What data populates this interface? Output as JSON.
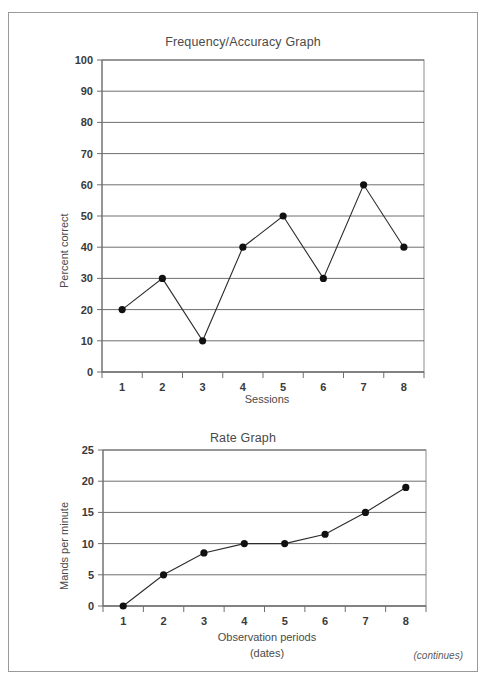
{
  "page": {
    "note": "(continues)"
  },
  "chart_data": [
    {
      "type": "line",
      "title": "Frequency/Accuracy Graph",
      "xlabel": "Sessions",
      "ylabel": "Percent correct",
      "categories": [
        "1",
        "2",
        "3",
        "4",
        "5",
        "6",
        "7",
        "8"
      ],
      "values": [
        20,
        30,
        10,
        40,
        50,
        30,
        60,
        40
      ],
      "yticks": [
        "0",
        "10",
        "20",
        "30",
        "40",
        "50",
        "60",
        "70",
        "80",
        "90",
        "100"
      ],
      "ytick_values": [
        0,
        10,
        20,
        30,
        40,
        50,
        60,
        70,
        80,
        90,
        100
      ],
      "ylim": [
        0,
        100
      ],
      "grid": true,
      "legend": "none",
      "marker": "filled-circle",
      "line_color": "#2b2b2b",
      "marker_color": "#111111",
      "grid_color": "#5d5d5d"
    },
    {
      "type": "line",
      "title": "Rate Graph",
      "xlabel": "Observation periods",
      "xlabel_line2": "(dates)",
      "ylabel": "Mands per minute",
      "categories": [
        "1",
        "2",
        "3",
        "4",
        "5",
        "6",
        "7",
        "8"
      ],
      "values": [
        0,
        5,
        8.5,
        10,
        10,
        11.5,
        15,
        19
      ],
      "yticks": [
        "0",
        "5",
        "10",
        "15",
        "20",
        "25"
      ],
      "ytick_values": [
        0,
        5,
        10,
        15,
        20,
        25
      ],
      "ylim": [
        0,
        25
      ],
      "grid": true,
      "legend": "none",
      "marker": "filled-circle",
      "line_color": "#2b2b2b",
      "marker_color": "#111111",
      "grid_color": "#5d5d5d"
    }
  ]
}
